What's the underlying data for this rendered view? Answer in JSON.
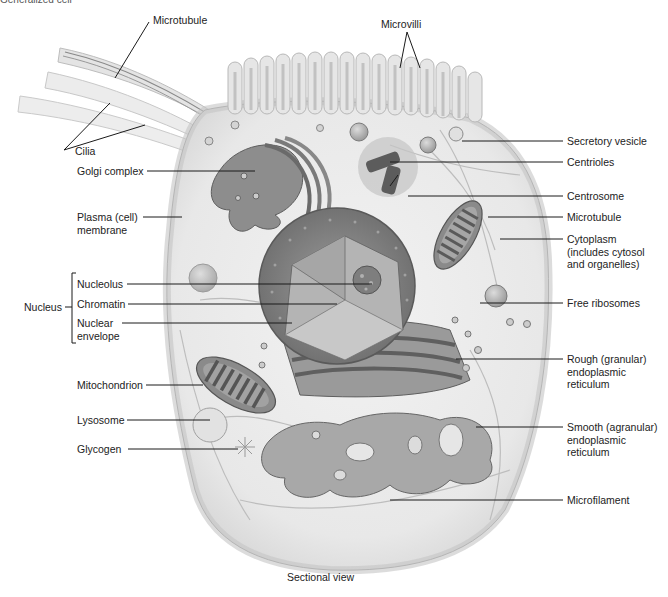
{
  "figure": {
    "top_caption_partial": "Generalized cell",
    "bottom_caption": "Sectional view"
  },
  "labels": {
    "top": {
      "microtubule_cilia": "Microtubule",
      "microvilli": "Microvilli"
    },
    "left": {
      "cilia": "Cilia",
      "golgi_complex": "Golgi complex",
      "plasma_membrane": "Plasma (cell)\nmembrane",
      "nucleus_group": "Nucleus",
      "nucleolus": "Nucleolus",
      "chromatin": "Chromatin",
      "nuclear_envelope": "Nuclear\nenvelope",
      "mitochondrion": "Mitochondrion",
      "lysosome": "Lysosome",
      "glycogen": "Glycogen"
    },
    "right": {
      "secretory_vesicle": "Secretory vesicle",
      "centrioles": "Centrioles",
      "centrosome": "Centrosome",
      "microtubule": "Microtubule",
      "cytoplasm": "Cytoplasm\n(includes cytosol\nand organelles)",
      "free_ribosomes": "Free ribosomes",
      "rough_er": "Rough (granular)\nendoplasmic\nreticulum",
      "smooth_er": "Smooth (agranular)\nendoplasmic\nreticulum",
      "microfilament": "Microfilament"
    }
  },
  "colors": {
    "background": "#ffffff",
    "cell_outer": "#e6e6e6",
    "cytoplasm": "#eeeeee",
    "organelle_dark": "#7a7a7a",
    "organelle_mid": "#a8a8a8",
    "nucleus_shell": "#8c8c8c",
    "nucleus_inner": "#b9b9b9",
    "leader_line": "#1a1a1a"
  }
}
